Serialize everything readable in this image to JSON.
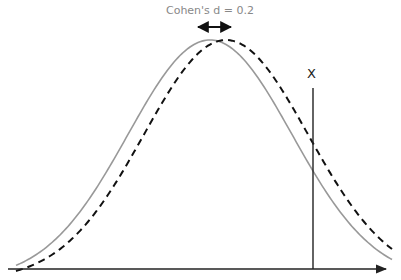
{
  "diagram": {
    "effect_size_label": "Cohen's d = 0.2",
    "marker_label": "X",
    "colors": {
      "solid_curve": "#999999",
      "dashed_curve": "#111111",
      "axis": "#222222",
      "marker_line": "#222222",
      "label": "#888888"
    }
  },
  "chart_data": {
    "type": "line",
    "title": "Cohen's d = 0.2",
    "xlabel": "",
    "ylabel": "",
    "series": [
      {
        "name": "distribution-1",
        "style": "solid",
        "color": "#999999",
        "mean": 0.0,
        "sd": 1.0
      },
      {
        "name": "distribution-2",
        "style": "dashed",
        "color": "#111111",
        "mean": 0.2,
        "sd": 1.0
      }
    ],
    "annotations": [
      {
        "type": "double-arrow",
        "text": "Cohen's d = 0.2",
        "between_means": true
      },
      {
        "type": "vertical-line",
        "text": "X"
      }
    ],
    "grid": false,
    "legend": "none"
  }
}
